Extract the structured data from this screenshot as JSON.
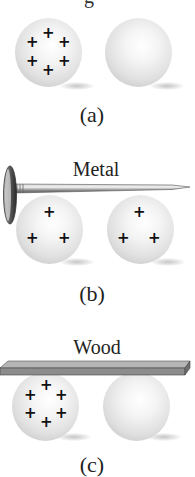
{
  "figure": {
    "top_cutoff_text": "g",
    "panels": [
      {
        "id": "a",
        "caption": "(a)",
        "material": "",
        "left_sphere": {
          "charges": [
            "+",
            "+",
            "+",
            "+",
            "+",
            "+"
          ],
          "charge_count": 6
        },
        "right_sphere": {
          "charges": [],
          "charge_count": 0
        }
      },
      {
        "id": "b",
        "caption": "(b)",
        "material": "Metal",
        "connector": "nail",
        "left_sphere": {
          "charges": [
            "+",
            "+",
            "+"
          ],
          "charge_count": 3
        },
        "right_sphere": {
          "charges": [
            "+",
            "+",
            "+"
          ],
          "charge_count": 3
        }
      },
      {
        "id": "c",
        "caption": "(c)",
        "material": "Wood",
        "connector": "plank",
        "left_sphere": {
          "charges": [
            "+",
            "+",
            "+",
            "+",
            "+",
            "+"
          ],
          "charge_count": 6
        },
        "right_sphere": {
          "charges": [],
          "charge_count": 0
        }
      }
    ],
    "colors": {
      "background": "#ffffff",
      "text": "#222222",
      "plus_sign": "#111111",
      "sphere_light": "#f4f4f4",
      "sphere_dark": "#c4c4c4",
      "metal": "#8a8a8a",
      "wood": "#8c8c8c"
    }
  }
}
